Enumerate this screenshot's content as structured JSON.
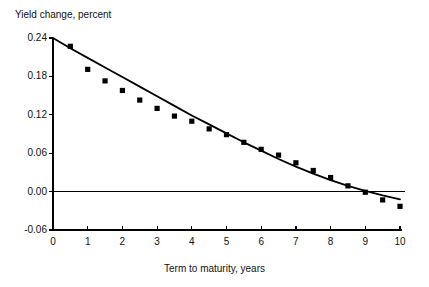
{
  "chart_data": {
    "type": "scatter",
    "title": "Yield change, percent",
    "xlabel": "Term to maturity, years",
    "ylabel": "",
    "xlim": [
      0,
      10
    ],
    "ylim": [
      -0.06,
      0.24
    ],
    "grid": false,
    "legend": null,
    "x_ticks": [
      "0",
      "1",
      "2",
      "3",
      "4",
      "5",
      "6",
      "7",
      "8",
      "9",
      "10"
    ],
    "x_tick_values": [
      0,
      1,
      2,
      3,
      4,
      5,
      6,
      7,
      8,
      9,
      10
    ],
    "y_ticks": [
      "0.24",
      "0.18",
      "0.12",
      "0.06",
      "0.00",
      "-0.06"
    ],
    "y_tick_values": [
      0.24,
      0.18,
      0.12,
      0.06,
      0.0,
      -0.06
    ],
    "zero_reference_line": 0.0,
    "marker": "square",
    "marker_color": "#000000",
    "line_color": "#000000",
    "series": [
      {
        "name": "Observed yield change",
        "type": "scatter",
        "x": [
          0.5,
          1.0,
          1.5,
          2.0,
          2.5,
          3.0,
          3.5,
          4.0,
          4.5,
          5.0,
          5.5,
          6.0,
          6.5,
          7.0,
          7.5,
          8.0,
          8.5,
          9.0,
          9.5,
          10.0
        ],
        "values": [
          0.227,
          0.191,
          0.173,
          0.158,
          0.143,
          0.13,
          0.118,
          0.11,
          0.098,
          0.089,
          0.077,
          0.066,
          0.057,
          0.045,
          0.033,
          0.022,
          0.009,
          -0.001,
          -0.013,
          -0.023
        ]
      },
      {
        "name": "Fitted curve",
        "type": "line",
        "x": [
          0.0,
          0.5,
          1.0,
          1.5,
          2.0,
          2.5,
          3.0,
          3.5,
          4.0,
          4.5,
          5.0,
          5.5,
          6.0,
          6.5,
          7.0,
          7.5,
          8.0,
          8.5,
          9.0,
          9.5,
          10.0
        ],
        "values": [
          0.24,
          0.224,
          0.209,
          0.194,
          0.179,
          0.164,
          0.149,
          0.134,
          0.119,
          0.105,
          0.091,
          0.077,
          0.064,
          0.051,
          0.039,
          0.028,
          0.018,
          0.009,
          0.001,
          -0.006,
          -0.012
        ]
      }
    ]
  }
}
